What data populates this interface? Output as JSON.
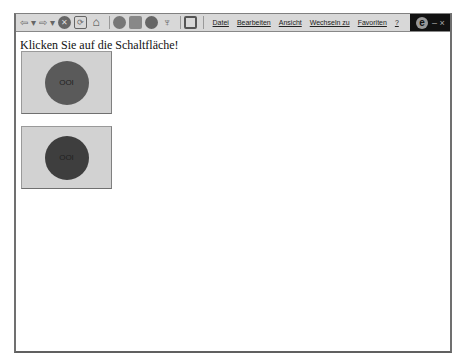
{
  "toolbar": {
    "buttons": [
      {
        "name": "back",
        "icon": "back-arrow-icon",
        "glyph": "⇦ ▾"
      },
      {
        "name": "forward",
        "icon": "forward-arrow-icon",
        "glyph": "⇨ ▾"
      },
      {
        "name": "stop",
        "icon": "stop-icon",
        "glyph": "✕"
      },
      {
        "name": "refresh",
        "icon": "refresh-icon",
        "glyph": "⟳"
      },
      {
        "name": "home",
        "icon": "home-icon",
        "glyph": "⌂"
      },
      {
        "name": "search",
        "icon": "search-icon",
        "glyph": "🔍"
      },
      {
        "name": "favorites",
        "icon": "favorites-icon",
        "glyph": "★"
      },
      {
        "name": "history",
        "icon": "history-icon",
        "glyph": "◔"
      },
      {
        "name": "channels",
        "icon": "channels-icon",
        "glyph": "♆"
      },
      {
        "name": "fullscreen",
        "icon": "fullscreen-icon",
        "glyph": "▭"
      }
    ]
  },
  "menu": {
    "items": [
      "Datei",
      "Bearbeiten",
      "Ansicht",
      "Wechseln zu",
      "Favoriten",
      "?"
    ]
  },
  "brand": {
    "logo": "e",
    "controls": "– ×"
  },
  "page": {
    "heading": "Klicken Sie auf die Schaltfläche!",
    "buttons": [
      {
        "label": "OOI",
        "circle_color": "#5a5a5a"
      },
      {
        "label": "OOI",
        "circle_color": "#3e3e3e"
      }
    ]
  },
  "colors": {
    "button_bg": "#d2d2d2",
    "toolbar_bg": "#d8d8d8",
    "brand_bg": "#111111"
  }
}
